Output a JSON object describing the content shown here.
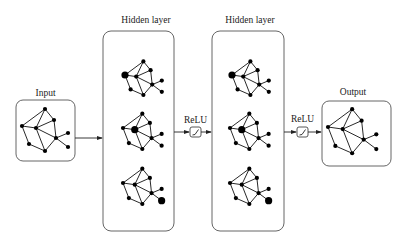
{
  "diagram": {
    "labels": {
      "input": "Input",
      "hidden1": "Hidden layer",
      "hidden2": "Hidden layer",
      "relu1": "ReLU",
      "relu2": "ReLU",
      "output": "Output"
    },
    "colors": {
      "background": "#ffffff",
      "stroke": "#555555",
      "node": "#000000"
    },
    "graph_template": {
      "nodes": [
        {
          "id": "top",
          "dx": 23,
          "dy": -17
        },
        {
          "id": "upper-right",
          "dx": 32,
          "dy": -6
        },
        {
          "id": "left",
          "dx": 0,
          "dy": 0
        },
        {
          "id": "center",
          "dx": 14,
          "dy": 2
        },
        {
          "id": "hub",
          "dx": 34,
          "dy": 12
        },
        {
          "id": "right-top",
          "dx": 46,
          "dy": 7
        },
        {
          "id": "right-bottom",
          "dx": 46,
          "dy": 21
        },
        {
          "id": "lower-left",
          "dx": 7,
          "dy": 18
        },
        {
          "id": "bottom",
          "dx": 23,
          "dy": 25
        }
      ],
      "edges": [
        [
          "left",
          "top"
        ],
        [
          "left",
          "center"
        ],
        [
          "left",
          "lower-left"
        ],
        [
          "top",
          "center"
        ],
        [
          "top",
          "upper-right"
        ],
        [
          "upper-right",
          "center"
        ],
        [
          "upper-right",
          "hub"
        ],
        [
          "center",
          "hub"
        ],
        [
          "center",
          "bottom"
        ],
        [
          "hub",
          "right-top"
        ],
        [
          "hub",
          "right-bottom"
        ],
        [
          "hub",
          "bottom"
        ],
        [
          "lower-left",
          "bottom"
        ]
      ]
    },
    "graphs": [
      {
        "name": "input-graph",
        "x": 22,
        "y": 126,
        "scale": 1.0,
        "big": null
      },
      {
        "name": "hidden1-graph1",
        "x": 125,
        "y": 75,
        "scale": 0.8,
        "big": "left"
      },
      {
        "name": "hidden1-graph2",
        "x": 123,
        "y": 128,
        "scale": 0.84,
        "big": "center"
      },
      {
        "name": "hidden1-graph3",
        "x": 123,
        "y": 183,
        "scale": 0.84,
        "big": "right-bottom"
      },
      {
        "name": "hidden2-graph1",
        "x": 232,
        "y": 75,
        "scale": 0.8,
        "big": "left"
      },
      {
        "name": "hidden2-graph2",
        "x": 230,
        "y": 128,
        "scale": 0.84,
        "big": "center"
      },
      {
        "name": "hidden2-graph3",
        "x": 230,
        "y": 183,
        "scale": 0.84,
        "big": "right-bottom"
      },
      {
        "name": "output-graph",
        "x": 328,
        "y": 127,
        "scale": 1.05,
        "big": null
      }
    ]
  }
}
